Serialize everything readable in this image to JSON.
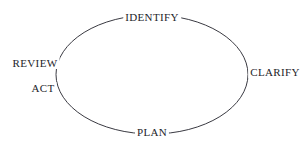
{
  "diagram": {
    "type": "cycle",
    "shape": "ellipse",
    "background_color": "#ffffff",
    "line_color": "#3a3a42",
    "text_color": "#24242a",
    "ellipse": {
      "center_x": 152,
      "center_y": 74.5,
      "radius_x": 96,
      "radius_y": 59.5,
      "stroke_width": 1
    },
    "nodes": [
      {
        "id": "identify",
        "label": "IDENTIFY",
        "position": "top"
      },
      {
        "id": "clarify",
        "label": "CLARIFY",
        "position": "right"
      },
      {
        "id": "plan",
        "label": "PLAN",
        "position": "bottom"
      },
      {
        "id": "review",
        "label": "REVIEW",
        "position": "left-upper"
      },
      {
        "id": "act",
        "label": "ACT",
        "position": "left-lower"
      }
    ]
  }
}
